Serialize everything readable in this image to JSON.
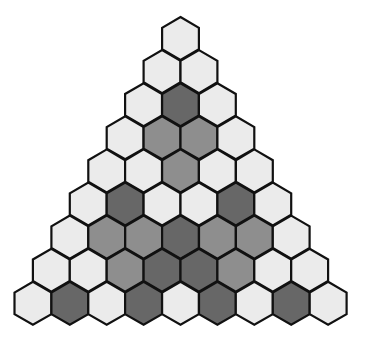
{
  "diagram": {
    "shape": "triangular arrangement of hexagons",
    "rows": 9,
    "legend": {
      "L": "light",
      "M": "medium",
      "D": "dark"
    },
    "colors": {
      "L": "#ebebeb",
      "M": "#8e8e8e",
      "D": "#676767",
      "stroke": "#111111",
      "background": "#ffffff"
    },
    "cells": [
      [
        "L"
      ],
      [
        "L",
        "L"
      ],
      [
        "L",
        "D",
        "L"
      ],
      [
        "L",
        "M",
        "M",
        "L"
      ],
      [
        "L",
        "L",
        "M",
        "L",
        "L"
      ],
      [
        "L",
        "D",
        "L",
        "L",
        "D",
        "L"
      ],
      [
        "L",
        "M",
        "M",
        "D",
        "M",
        "M",
        "L"
      ],
      [
        "L",
        "L",
        "M",
        "D",
        "D",
        "M",
        "L",
        "L"
      ],
      [
        "L",
        "D",
        "L",
        "D",
        "L",
        "D",
        "L",
        "D",
        "L"
      ]
    ]
  }
}
